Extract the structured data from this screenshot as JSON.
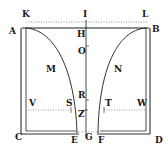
{
  "figure": {
    "colors": {
      "ink": "#1a1a1a",
      "paper": "#ffffff",
      "dotted": "#777777"
    },
    "labels": {
      "K": "K",
      "I": "I",
      "L": "L",
      "A": "A",
      "H": "H",
      "B": "B",
      "O": "O",
      "M": "M",
      "N": "N",
      "P": "R",
      "S": "S",
      "Z": "Z",
      "T": "T",
      "V": "V",
      "W": "W",
      "C": "C",
      "E": "E",
      "G": "G",
      "F": "F",
      "D": "D"
    }
  }
}
